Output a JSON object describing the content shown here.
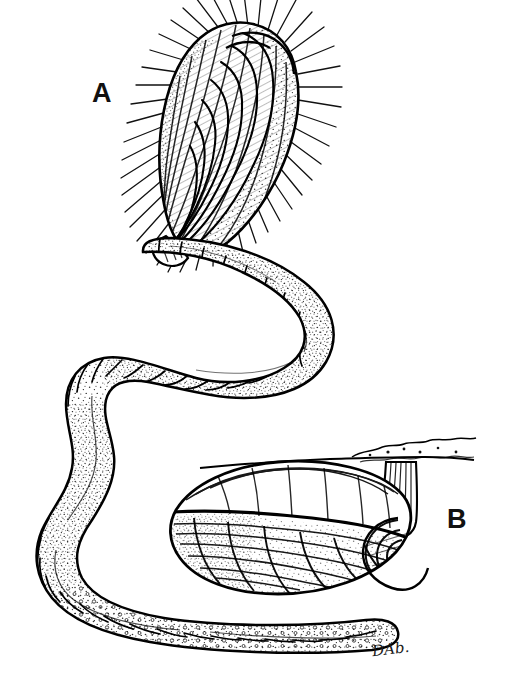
{
  "figure": {
    "background_color": "#ffffff",
    "ink_color": "#000000",
    "width": 507,
    "height": 692,
    "labels": {
      "panel_a": "A",
      "panel_b": "B"
    },
    "signature": "DAb.",
    "panel_a": {
      "label": "A",
      "description": "Elongate ovate bristled specimen with concentric growth lines and radiating marginal setae, attached at its narrow base to a segmented tube",
      "features": [
        "radiating marginal bristles",
        "concentric growth ridges",
        "hatched shading",
        "stippled margin",
        "narrow attachment base"
      ]
    },
    "panel_b": {
      "label": "B",
      "description": "Lenticular shelled specimen in lateral view suspended by a fluted stalk from a horizontal substrate",
      "features": [
        "lenticular valve outline",
        "fine concentric growth lines",
        "stippled ventral band",
        "fluted peduncle stalk",
        "horizontal substrate line"
      ]
    },
    "tube": {
      "description": "Sinuous annulated worm tube running from upper specimen down through an S-curve to a granular distal end",
      "features": [
        "annulated segments",
        "stippled texture",
        "granular ringed distal region",
        "rounded terminal tip"
      ]
    }
  }
}
